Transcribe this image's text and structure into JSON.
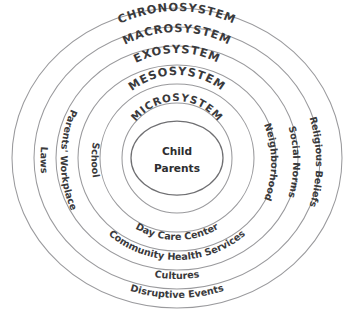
{
  "diagram": {
    "type": "concentric-ellipses",
    "background_color": "#ffffff",
    "stroke_color": "#9a9a9d",
    "text_color": "#3a3a3c",
    "center": {
      "line1": "Child",
      "line2": "Parents"
    },
    "system_rings": [
      {
        "id": "chronosystem",
        "label": "CHRONOSYSTEM",
        "level": 5
      },
      {
        "id": "macrosystem",
        "label": "MACROSYSTEM",
        "level": 4
      },
      {
        "id": "exosystem",
        "label": "EXOSYSTEM",
        "level": 3
      },
      {
        "id": "mesosystem",
        "label": "MESOSYSTEM",
        "level": 2
      },
      {
        "id": "microsystem",
        "label": "MICROSYSTEM",
        "level": 1
      }
    ],
    "context_labels": {
      "left": [
        {
          "id": "laws",
          "label": "Laws",
          "ring": "macrosystem"
        },
        {
          "id": "parents-workplace",
          "label": "Parents' Workplace",
          "ring": "exosystem"
        },
        {
          "id": "school",
          "label": "School",
          "ring": "mesosystem"
        }
      ],
      "right": [
        {
          "id": "neighborhood",
          "label": "Neighborhood",
          "ring": "mesosystem"
        },
        {
          "id": "social-norms",
          "label": "Social Norms",
          "ring": "exosystem"
        },
        {
          "id": "religious-beliefs",
          "label": "Religious Beliefs",
          "ring": "macrosystem"
        }
      ],
      "bottom": [
        {
          "id": "day-care-center",
          "label": "Day Care Center",
          "ring": "mesosystem"
        },
        {
          "id": "community-health-services",
          "label": "Community Health Services",
          "ring": "exosystem"
        },
        {
          "id": "cultures",
          "label": "Cultures",
          "ring": "macrosystem"
        },
        {
          "id": "disruptive-events",
          "label": "Disruptive Events",
          "ring": "chronosystem"
        }
      ]
    }
  }
}
